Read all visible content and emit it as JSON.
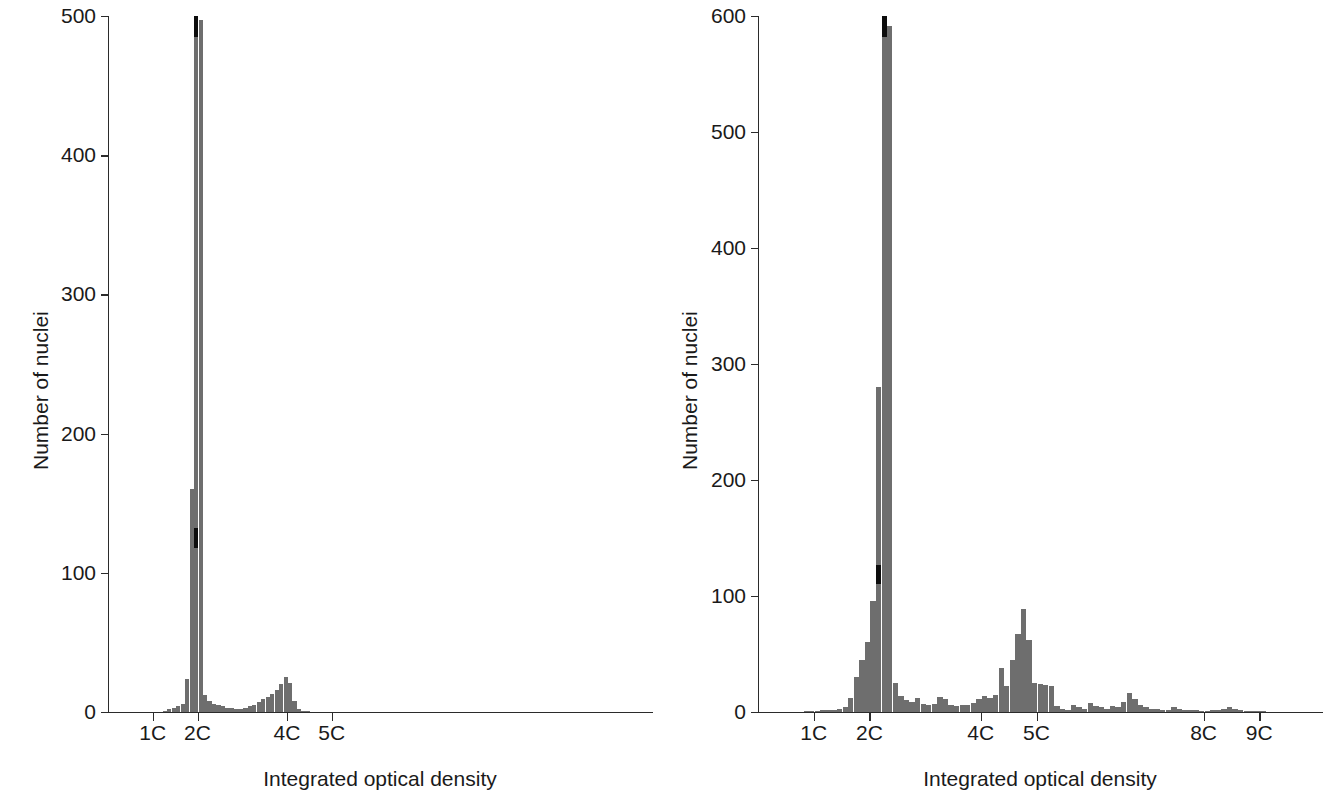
{
  "figure": {
    "background": "#ffffff",
    "bar_color": "#6e6e6e",
    "marker_color": "#0d0d0d",
    "axis_color": "#2b2b2b"
  },
  "chart_data": [
    {
      "id": "left",
      "type": "bar",
      "title": "",
      "xlabel": "Integrated optical density",
      "ylabel": "Number of nuclei",
      "ylim": [
        0,
        500
      ],
      "ytick_values": [
        0,
        100,
        200,
        300,
        400,
        500
      ],
      "ytick_labels": [
        "0",
        "100",
        "200",
        "300",
        "400",
        "500"
      ],
      "xlim": [
        0.0,
        12.0
      ],
      "xtick_values": [
        1,
        2,
        4,
        5
      ],
      "xtick_labels": [
        "1C",
        "2C",
        "4C",
        "5C"
      ],
      "grid": false,
      "legend": "none",
      "bin_width": 0.1,
      "x": [
        1.0,
        1.1,
        1.2,
        1.3,
        1.4,
        1.5,
        1.6,
        1.7,
        1.8,
        1.9,
        2.0,
        2.1,
        2.2,
        2.3,
        2.4,
        2.5,
        2.6,
        2.7,
        2.8,
        2.9,
        3.0,
        3.1,
        3.2,
        3.3,
        3.4,
        3.5,
        3.6,
        3.7,
        3.8,
        3.9,
        4.0,
        4.1,
        4.2,
        4.3,
        4.4,
        4.5,
        4.6,
        4.7,
        4.8,
        4.9,
        5.0
      ],
      "values": [
        0,
        0,
        1,
        2,
        3,
        4,
        6,
        24,
        160,
        500,
        497,
        12,
        8,
        6,
        5,
        4,
        3,
        3,
        2,
        2,
        3,
        4,
        5,
        7,
        9,
        11,
        13,
        16,
        20,
        25,
        21,
        8,
        2,
        1,
        1,
        0,
        0,
        0,
        0,
        0,
        0
      ],
      "marker_annotation": {
        "description": "black segment on the 2C peak bar",
        "x": 1.9,
        "y_from": 118,
        "y_to": 132
      },
      "peak_annotation": {
        "description": "black cap at the clipped top of the 2C peak bar",
        "x": 1.9,
        "y_from": 485,
        "y_to": 500
      }
    },
    {
      "id": "right",
      "type": "bar",
      "title": "",
      "xlabel": "Integrated optical density",
      "ylabel": "Number of nuclei",
      "ylim": [
        0,
        600
      ],
      "ytick_values": [
        0,
        100,
        200,
        300,
        400,
        500,
        600
      ],
      "ytick_labels": [
        "0",
        "100",
        "200",
        "300",
        "400",
        "500",
        "600"
      ],
      "xlim": [
        0.0,
        10.0
      ],
      "xtick_values": [
        1,
        2,
        4,
        5,
        8,
        9
      ],
      "xtick_labels": [
        "1C",
        "2C",
        "4C",
        "5C",
        "8C",
        "9C"
      ],
      "grid": false,
      "legend": "none",
      "bin_width": 0.1,
      "x": [
        0.5,
        0.6,
        0.7,
        0.8,
        0.9,
        1.0,
        1.1,
        1.2,
        1.3,
        1.4,
        1.5,
        1.6,
        1.7,
        1.8,
        1.9,
        2.0,
        2.1,
        2.2,
        2.3,
        2.4,
        2.5,
        2.6,
        2.7,
        2.8,
        2.9,
        3.0,
        3.1,
        3.2,
        3.3,
        3.4,
        3.5,
        3.6,
        3.7,
        3.8,
        3.9,
        4.0,
        4.1,
        4.2,
        4.3,
        4.4,
        4.5,
        4.6,
        4.7,
        4.8,
        4.9,
        5.0,
        5.1,
        5.2,
        5.3,
        5.4,
        5.5,
        5.6,
        5.7,
        5.8,
        5.9,
        6.0,
        6.1,
        6.2,
        6.3,
        6.4,
        6.5,
        6.6,
        6.7,
        6.8,
        6.9,
        7.0,
        7.1,
        7.2,
        7.3,
        7.4,
        7.5,
        7.6,
        7.7,
        7.8,
        7.9,
        8.0,
        8.1,
        8.2,
        8.3,
        8.4,
        8.5,
        8.6,
        8.7,
        8.8,
        8.9,
        9.0
      ],
      "values": [
        0,
        0,
        0,
        1,
        1,
        1,
        2,
        2,
        2,
        3,
        4,
        12,
        30,
        45,
        60,
        96,
        280,
        600,
        591,
        25,
        14,
        10,
        9,
        12,
        7,
        6,
        7,
        13,
        11,
        6,
        5,
        6,
        6,
        8,
        11,
        14,
        12,
        15,
        38,
        22,
        45,
        67,
        89,
        62,
        25,
        24,
        23,
        22,
        5,
        3,
        2,
        6,
        4,
        3,
        8,
        5,
        4,
        3,
        5,
        4,
        9,
        16,
        11,
        6,
        4,
        3,
        3,
        2,
        2,
        4,
        3,
        2,
        2,
        2,
        1,
        1,
        2,
        2,
        3,
        4,
        3,
        2,
        1,
        1,
        1,
        1
      ],
      "marker_annotation": {
        "description": "black segment on the 2C peak bar",
        "x": 2.1,
        "y_from": 110,
        "y_to": 127
      },
      "peak_annotation": {
        "description": "black cap at the clipped top of the 2C peak bar",
        "x": 2.2,
        "y_from": 582,
        "y_to": 600
      }
    }
  ]
}
